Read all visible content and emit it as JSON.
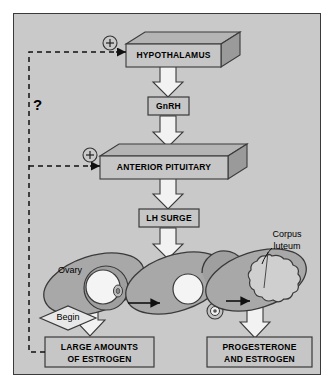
{
  "diagram": {
    "background_color": "#c9c9c9",
    "frame_color": "#3a3a3a",
    "organ_fill": "#a8a8a8",
    "box_fill": "#c0c0c0",
    "arrow_fill": "#f2f2f2"
  },
  "nodes": {
    "hypothalamus": {
      "label": "HYPOTHALAMUS"
    },
    "gnrh": {
      "label": "GnRH"
    },
    "anterior_pituitary": {
      "label": "ANTERIOR PITUITARY"
    },
    "lh_surge": {
      "label": "LH SURGE"
    },
    "estrogen": {
      "line1": "LARGE AMOUNTS",
      "line2": "OF ESTROGEN"
    },
    "progesterone": {
      "line1": "PROGESTERONE",
      "line2": "AND ESTROGEN"
    }
  },
  "annotations": {
    "ovary": "Ovary",
    "begin": "Begin",
    "corpus_luteum_line1": "Corpus",
    "corpus_luteum_line2": "luteum",
    "question": "?",
    "plus_hypothalamus": "+",
    "plus_pituitary": "+"
  },
  "flow": {
    "feedback_targets": [
      "hypothalamus",
      "anterior_pituitary"
    ],
    "feedback_source": "estrogen",
    "feedback_style": "dashed",
    "stages": [
      "follicle",
      "ovulation",
      "corpus-luteum"
    ]
  }
}
